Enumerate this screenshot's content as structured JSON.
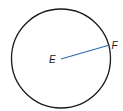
{
  "diagram": {
    "type": "circle-with-radius",
    "circle": {
      "cx": 61,
      "cy": 58.5,
      "r": 49.5,
      "stroke": "#1a1a1a"
    },
    "radius_segment": {
      "x1": 61,
      "y1": 59,
      "x2": 109.5,
      "y2": 45,
      "stroke": "#2e6bb0"
    },
    "labels": {
      "center": "E",
      "point": "F"
    }
  }
}
